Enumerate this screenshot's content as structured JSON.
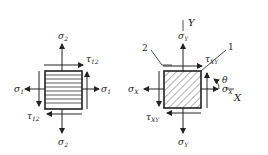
{
  "figure_left": {
    "title": "principal material axes element",
    "labels": {
      "sigma_top": "σ",
      "sigma_top_sub": "2",
      "sigma_bottom": "σ",
      "sigma_bottom_sub": "2",
      "sigma_left": "σ",
      "sigma_left_sub": "1",
      "sigma_right": "σ",
      "sigma_right_sub": "1",
      "tau_top": "τ",
      "tau_top_sub": "12",
      "tau_bottom": "τ",
      "tau_bottom_sub": "12"
    },
    "fill_pattern": "horizontal-lines"
  },
  "figure_right": {
    "title": "global axes element",
    "labels": {
      "axis_y": "Y",
      "axis_x": "X",
      "sigma_top": "σ",
      "sigma_top_sub": "Y",
      "sigma_bottom": "σ",
      "sigma_bottom_sub": "Y",
      "sigma_left": "σ",
      "sigma_left_sub": "X",
      "sigma_right": "σ",
      "sigma_right_sub": "X",
      "tau_top": "τ",
      "tau_top_sub": "XY",
      "tau_bottom": "τ",
      "tau_bottom_sub": "XY",
      "direction_1": "1",
      "direction_2": "2",
      "angle": "θ"
    },
    "fill_pattern": "diagonal-hatch"
  },
  "colors": {
    "line": "#222222",
    "background": "#ffffff"
  }
}
